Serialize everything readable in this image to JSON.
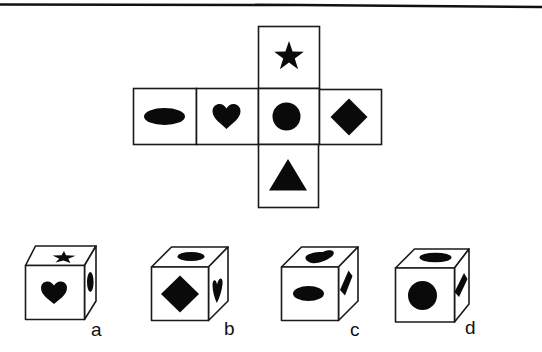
{
  "puzzle": {
    "type": "cube-net-folding",
    "net": {
      "faces": [
        {
          "position": "top",
          "symbol": "star"
        },
        {
          "position": "left-outer",
          "symbol": "oval"
        },
        {
          "position": "left",
          "symbol": "heart"
        },
        {
          "position": "center",
          "symbol": "circle"
        },
        {
          "position": "right",
          "symbol": "diamond"
        },
        {
          "position": "bottom",
          "symbol": "triangle"
        }
      ]
    },
    "options": [
      {
        "label": "a",
        "front": "heart",
        "top": "star",
        "right": "oval"
      },
      {
        "label": "b",
        "front": "diamond",
        "top": "oval",
        "right": "heart"
      },
      {
        "label": "c",
        "front": "oval",
        "top": "heart",
        "right": "diamond"
      },
      {
        "label": "d",
        "front": "circle",
        "top": "oval",
        "right": "diamond"
      }
    ]
  },
  "colors": {
    "ink": "#0a0a0a",
    "background": "#ffffff"
  }
}
